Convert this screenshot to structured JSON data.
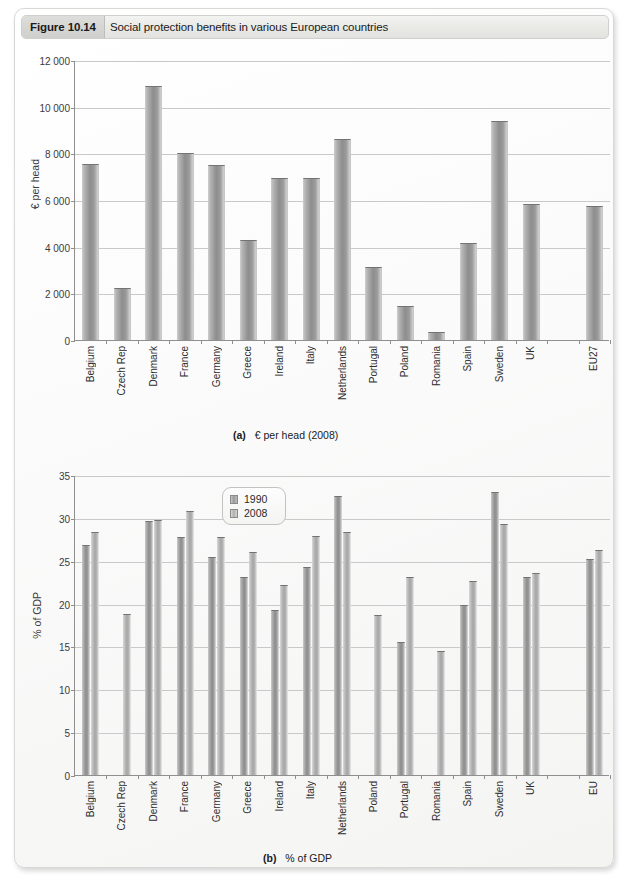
{
  "figure": {
    "number": "Figure 10.14",
    "title": "Social protection benefits in various European countries"
  },
  "chart_a": {
    "caption_prefix": "(a)",
    "caption_text": "€ per head (2008)",
    "ylabel": "€ per head"
  },
  "chart_b": {
    "caption_prefix": "(b)",
    "caption_text": "% of GDP",
    "ylabel": "% of GDP",
    "legend": [
      "1990",
      "2008"
    ]
  },
  "chart_data": [
    {
      "type": "bar",
      "title": "(a) € per head (2008)",
      "xlabel": "",
      "ylabel": "€ per head",
      "ylim": [
        0,
        12000
      ],
      "yticks": [
        "0",
        "2 000",
        "4 000",
        "6 000",
        "8 000",
        "10 000",
        "12 000"
      ],
      "ytick_values": [
        0,
        2000,
        4000,
        6000,
        8000,
        10000,
        12000
      ],
      "grid": true,
      "legend": "none",
      "categories": [
        "Belgium",
        "Czech Rep",
        "Denmark",
        "France",
        "Germany",
        "Greece",
        "Ireland",
        "Italy",
        "Netherlands",
        "Portugal",
        "Poland",
        "Romania",
        "Spain",
        "Sweden",
        "UK",
        "",
        "EU27"
      ],
      "values": [
        7500,
        2200,
        10850,
        7950,
        7450,
        4250,
        6900,
        6900,
        8550,
        3100,
        1400,
        300,
        4100,
        9350,
        5800,
        null,
        5700
      ]
    },
    {
      "type": "bar",
      "title": "(b) % of GDP",
      "xlabel": "",
      "ylabel": "% of GDP",
      "ylim": [
        0,
        35
      ],
      "yticks": [
        "0",
        "5",
        "10",
        "15",
        "20",
        "25",
        "30",
        "35"
      ],
      "ytick_values": [
        0,
        5,
        10,
        15,
        20,
        25,
        30,
        35
      ],
      "grid": true,
      "legend_position": "top-center",
      "categories": [
        "Belgium",
        "Czech Rep",
        "Denmark",
        "France",
        "Germany",
        "Greece",
        "Ireland",
        "Italy",
        "Netherlands",
        "Poland",
        "Portugal",
        "Romania",
        "Spain",
        "Sweden",
        "UK",
        "",
        "EU"
      ],
      "series": [
        {
          "name": "1990",
          "values": [
            26.7,
            null,
            29.5,
            27.7,
            25.3,
            23.0,
            19.1,
            24.1,
            32.4,
            null,
            15.4,
            null,
            19.7,
            32.9,
            23.0,
            null,
            25.1
          ]
        },
        {
          "name": "2008",
          "values": [
            28.2,
            18.7,
            29.6,
            30.7,
            27.7,
            25.9,
            22.1,
            27.8,
            28.2,
            18.5,
            23.0,
            14.3,
            22.5,
            29.2,
            23.4,
            null,
            26.1
          ]
        }
      ]
    }
  ],
  "colors": {
    "bar_dark": "#8d8d8d",
    "bar_light": "#a6a6a6",
    "axis": "#8f8f8f",
    "grid": "#c9c9c9",
    "header_tab": "#cfcfcc"
  }
}
